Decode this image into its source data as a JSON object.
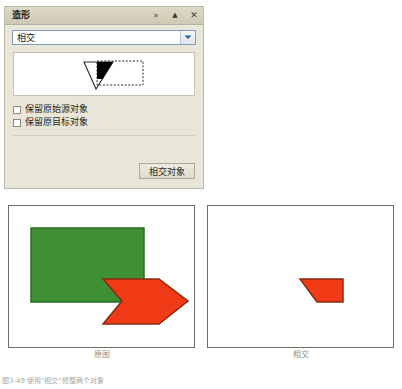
{
  "panel": {
    "title": "造形",
    "titlebar_buttons": [
      {
        "name": "expand-collapse-chevrons",
        "glyph": "»"
      },
      {
        "name": "collapse-triangle",
        "glyph": "▲"
      },
      {
        "name": "close",
        "glyph": "✕"
      }
    ],
    "operation_select": {
      "value": "相交",
      "options": [
        "相交",
        "联集",
        "差集",
        "剪裁",
        "熔接"
      ]
    },
    "preview": {
      "alt": "triangle-intersecting-dashed-rectangle",
      "fill_color": "#000000",
      "outline_color": "#1a1a1a"
    },
    "checkboxes": [
      {
        "label": "保留原始源对象",
        "checked": false
      },
      {
        "label": "保留原目标对象",
        "checked": false
      }
    ],
    "action_button": "相交对象"
  },
  "figure": {
    "panels": [
      {
        "caption": "原图"
      },
      {
        "caption": "相交"
      }
    ],
    "colors": {
      "green_fill": "#3f8f35",
      "green_stroke": "#2d6b25",
      "red_fill": "#f03b16",
      "red_stroke": "#8a2a10",
      "canvas_border": "#6e6a5f"
    }
  },
  "bottom_caption": "图3-49  使用\"相交\"修整两个对象"
}
